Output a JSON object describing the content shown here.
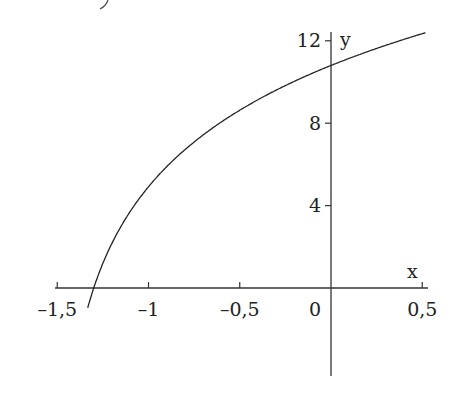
{
  "chart_data": {
    "type": "line",
    "title": "",
    "xlabel": "x",
    "ylabel": "y",
    "xlim": [
      -1.5,
      0.5
    ],
    "ylim": [
      -4,
      12
    ],
    "grid": false,
    "x_ticks": [
      {
        "value": -1.5,
        "label": "–1,5"
      },
      {
        "value": -1,
        "label": "–1"
      },
      {
        "value": -0.5,
        "label": "–0,5"
      },
      {
        "value": 0,
        "label": "0"
      },
      {
        "value": 0.5,
        "label": "0,5"
      }
    ],
    "y_ticks": [
      {
        "value": 4,
        "label": "4"
      },
      {
        "value": 8,
        "label": "8"
      },
      {
        "value": 12,
        "label": "12"
      }
    ],
    "series": [
      {
        "name": "curve",
        "description": "increasing concave logarithmic-type curve, crosses x-axis near x=-1.31, y-axis near y=10.8",
        "x": [
          -1.33,
          -1.31,
          -1.25,
          -1.2,
          -1.1,
          -1.0,
          -0.8,
          -0.6,
          -0.4,
          -0.2,
          0.0,
          0.2,
          0.4,
          0.5
        ],
        "y": [
          -4.3,
          0.0,
          1.2,
          2.2,
          3.7,
          4.9,
          6.7,
          8.0,
          9.0,
          9.9,
          10.8,
          11.4,
          12.0,
          12.3
        ]
      }
    ],
    "color": "#222222"
  }
}
